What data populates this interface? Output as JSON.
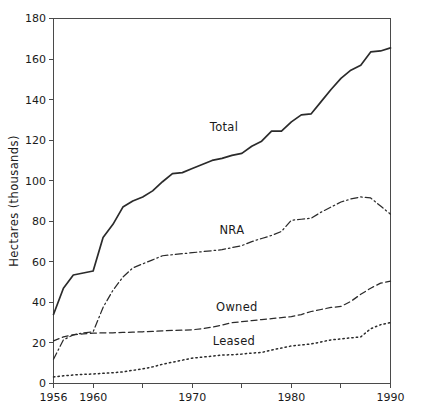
{
  "chart_data": {
    "type": "line",
    "title": "",
    "xlabel": "",
    "ylabel": "Hectares (thousands)",
    "xlim": [
      1956,
      1990
    ],
    "ylim": [
      0,
      180
    ],
    "grid": false,
    "legend_position": "inline-labels",
    "x": [
      1956,
      1957,
      1958,
      1959,
      1960,
      1961,
      1962,
      1963,
      1964,
      1965,
      1966,
      1967,
      1968,
      1969,
      1970,
      1971,
      1972,
      1973,
      1974,
      1975,
      1976,
      1977,
      1978,
      1979,
      1980,
      1981,
      1982,
      1983,
      1984,
      1985,
      1986,
      1987,
      1988,
      1989,
      1990
    ],
    "x_ticks": [
      1956,
      1960,
      1970,
      1980,
      1990
    ],
    "x_tick_labels": [
      "1956",
      "1960",
      "1970",
      "1980",
      "1990"
    ],
    "x_minor_ticks": [
      1965,
      1975,
      1985
    ],
    "y_ticks": [
      0,
      20,
      40,
      60,
      80,
      100,
      120,
      140,
      160,
      180
    ],
    "y_tick_labels": [
      "0",
      "20",
      "40",
      "60",
      "80",
      "100",
      "120",
      "140",
      "160",
      "180"
    ],
    "series": [
      {
        "name": "Total",
        "style": "solid",
        "label_x": 1973.2,
        "label_y": 124.5,
        "values": [
          34,
          47,
          53.5,
          54.5,
          55.5,
          72,
          78.5,
          87,
          90,
          92,
          95,
          99.5,
          103.5,
          104,
          106,
          108,
          110,
          111,
          112.5,
          113.5,
          117,
          119.5,
          124.5,
          124.5,
          129,
          132.5,
          133,
          139,
          145,
          150.5,
          154.5,
          157,
          163.5,
          164,
          165.5
        ]
      },
      {
        "name": "NRA",
        "style": "dash-dot",
        "label_x": 1974.0,
        "label_y": 73.5,
        "values": [
          12,
          21.5,
          24,
          25,
          25.5,
          37.5,
          46,
          52.5,
          57,
          59,
          61,
          63,
          63.5,
          64,
          64.5,
          65,
          65.5,
          66,
          67,
          68,
          70,
          71.5,
          73,
          75,
          80.5,
          81,
          81.5,
          84.5,
          87,
          89.5,
          91,
          92,
          91.5,
          87.5,
          83.5
        ]
      },
      {
        "name": "Owned",
        "style": "dashed",
        "label_x": 1974.5,
        "label_y": 36.0,
        "values": [
          21,
          23,
          24,
          24.5,
          24.8,
          25,
          25,
          25.2,
          25.3,
          25.5,
          25.7,
          26,
          26.2,
          26.3,
          26.5,
          27,
          27.8,
          28.8,
          30,
          30.5,
          31,
          31.5,
          32,
          32.5,
          33,
          34,
          35.5,
          36.5,
          37.5,
          38,
          40.5,
          44,
          47,
          49.5,
          50.5
        ]
      },
      {
        "name": "Leased",
        "style": "dotted",
        "label_x": 1974.2,
        "label_y": 19.0,
        "values": [
          3.2,
          3.8,
          4.2,
          4.5,
          4.7,
          5,
          5.3,
          5.7,
          6.5,
          7.2,
          8.2,
          9.5,
          10.5,
          11.5,
          12.5,
          13,
          13.5,
          14,
          14.2,
          14.5,
          15,
          15.3,
          16.5,
          17.5,
          18.5,
          19,
          19.5,
          20.5,
          21.5,
          22,
          22.5,
          23,
          27,
          29,
          30
        ]
      }
    ]
  }
}
